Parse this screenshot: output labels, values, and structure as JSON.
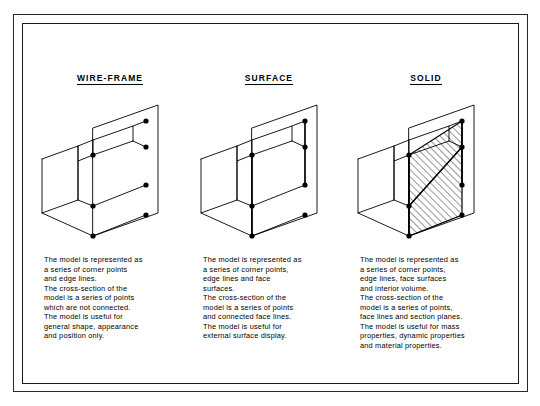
{
  "sheet": {
    "title": "CAD model representation comparison"
  },
  "columns": [
    {
      "id": "wire-frame",
      "label": "WIRE-FRAME",
      "description": "The model is represented as\na series of corner points\nand edge lines.\nThe cross-section of the\nmodel is a series of points\nwhich are not connected.\nThe model is useful for\ngeneral shape, appearance\nand position only.",
      "has_face_lines": false,
      "has_hatching": false
    },
    {
      "id": "surface",
      "label": "SURFACE",
      "description": "The model is represented as\na series of corner points,\nedge lines and face\nsurfaces.\nThe cross-section of the\nmodel is a series of points\nand connected face lines.\nThe model is useful for\nexternal surface display.",
      "has_face_lines": true,
      "has_hatching": false
    },
    {
      "id": "solid",
      "label": "SOLID",
      "description": "The model is represented as\na series of corner points,\nedge lines, face surfaces\nand interior volume.\nThe cross-section of the\nmodel is a series of points,\nface lines and section planes.\nThe model is useful for mass\nproperties, dynamic properties\nand material properties.",
      "has_face_lines": true,
      "has_hatching": true
    }
  ],
  "colors": {
    "line": "#000000",
    "frame": "#1a1a1a",
    "background": "#ffffff",
    "point": "#000000"
  }
}
